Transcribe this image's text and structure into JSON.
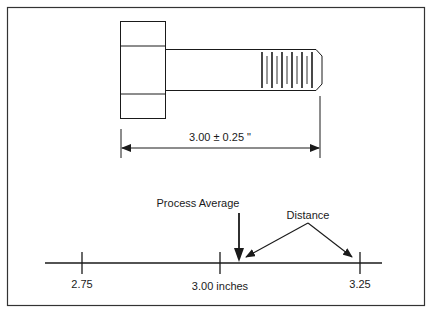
{
  "figure": {
    "type": "tolerance-diagram",
    "bolt": {
      "dimension_label": "3.00 ± 0.25 \"",
      "nominal": 3.0,
      "tolerance": 0.25,
      "unit": "inches"
    },
    "number_line": {
      "ticks": [
        {
          "value": 2.75,
          "label": "2.75"
        },
        {
          "value": 3.0,
          "label": "3.00 inches"
        },
        {
          "value": 3.25,
          "label": "3.25"
        }
      ],
      "annotations": {
        "process_average_label": "Process Average",
        "distance_label": "Distance"
      }
    }
  },
  "colors": {
    "line": "#1a1a1a",
    "frame": "#333333",
    "background": "#ffffff"
  }
}
